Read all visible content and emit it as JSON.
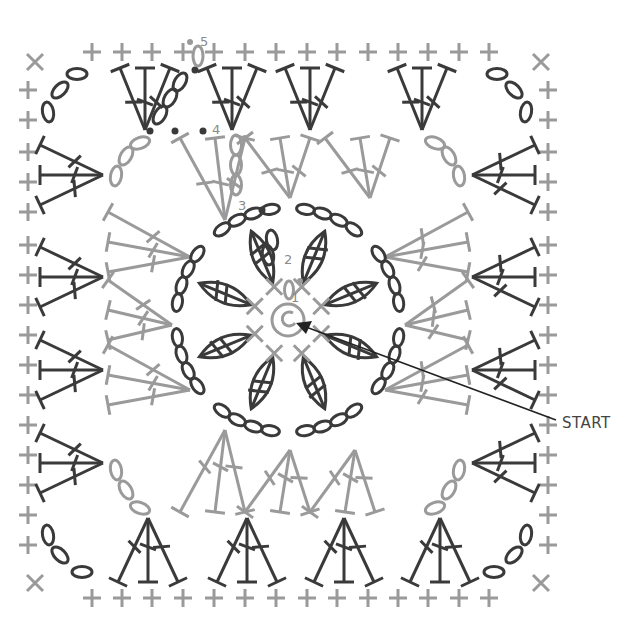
{
  "diagram": {
    "type": "crochet-chart",
    "colors": {
      "dark": "#3a3a3a",
      "light": "#9a9a9a",
      "arrow": "#222222"
    },
    "round_labels": [
      {
        "text": "1",
        "x": 291,
        "y": 302
      },
      {
        "text": "2",
        "x": 284,
        "y": 264
      },
      {
        "text": "3",
        "x": 238,
        "y": 210
      },
      {
        "text": "4",
        "x": 212,
        "y": 134
      },
      {
        "text": "5",
        "x": 200,
        "y": 46
      }
    ],
    "start_label": {
      "text": "START",
      "x": 562,
      "y": 428
    },
    "arrow": {
      "from": [
        556,
        420
      ],
      "to": [
        296,
        323
      ]
    },
    "center": {
      "x": 288,
      "y": 320,
      "ring_radius": 16
    }
  }
}
